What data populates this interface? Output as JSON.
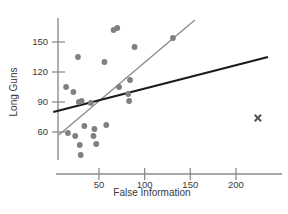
{
  "chart_data": {
    "type": "scatter",
    "title": "",
    "xlabel": "False Information",
    "ylabel": "Long Guns",
    "xlim": [
      0,
      235
    ],
    "ylim": [
      25,
      172
    ],
    "grid": false,
    "legend": null,
    "xticks": [
      50,
      100,
      150,
      200
    ],
    "yticks": [
      60,
      90,
      120,
      150
    ],
    "xtick_labels": [
      "50",
      "100",
      "150",
      "200"
    ],
    "ytick_labels": [
      "60",
      "90",
      "120",
      "150"
    ],
    "marker_color": "#808080",
    "outlier_marker_color": "#555555",
    "fit_line_all_color": "#1a1a1a",
    "fit_line_sub_color": "#8a8a8a",
    "axis_color": "#8c8c8c",
    "points": [
      {
        "x": 14,
        "y": 105
      },
      {
        "x": 16,
        "y": 59
      },
      {
        "x": 22,
        "y": 100
      },
      {
        "x": 24,
        "y": 56
      },
      {
        "x": 27,
        "y": 135
      },
      {
        "x": 28,
        "y": 90
      },
      {
        "x": 29,
        "y": 47
      },
      {
        "x": 30,
        "y": 37
      },
      {
        "x": 31,
        "y": 91
      },
      {
        "x": 34,
        "y": 66
      },
      {
        "x": 41,
        "y": 89
      },
      {
        "x": 44,
        "y": 56
      },
      {
        "x": 45,
        "y": 63
      },
      {
        "x": 47,
        "y": 48
      },
      {
        "x": 56,
        "y": 130
      },
      {
        "x": 58,
        "y": 67
      },
      {
        "x": 66,
        "y": 162
      },
      {
        "x": 70,
        "y": 164
      },
      {
        "x": 72,
        "y": 105
      },
      {
        "x": 82,
        "y": 98
      },
      {
        "x": 83,
        "y": 91
      },
      {
        "x": 84,
        "y": 112
      },
      {
        "x": 89,
        "y": 145
      },
      {
        "x": 131,
        "y": 154
      }
    ],
    "outlier_points": [
      {
        "x": 224,
        "y": 74,
        "marker": "x"
      }
    ],
    "fit_line_all": {
      "x0": 0,
      "y0": 80,
      "x1": 235,
      "y1": 135
    },
    "fit_line_subset": {
      "x0": 6,
      "y0": 57,
      "x1": 155,
      "y1": 172
    }
  }
}
